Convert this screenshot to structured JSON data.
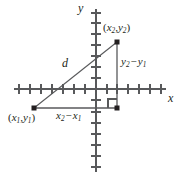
{
  "figure": {
    "type": "coordinate-plane-distance-formula",
    "background_color": "#ffffff",
    "stroke_color": "#58595b",
    "ink_color": "#231f20"
  },
  "axes": {
    "x_axis_label": "x",
    "y_axis_label": "y",
    "origin_px": {
      "x": 96,
      "y": 89
    },
    "tick_spacing_px": 11,
    "x_ticks_left_of_origin": 7,
    "x_ticks_right_of_origin": 6,
    "y_ticks_above_origin": 7,
    "y_ticks_below_origin": 7,
    "grid": false
  },
  "points": [
    {
      "name": "point-1",
      "label_parts": {
        "open": "(",
        "x_var": "x",
        "x_sub": "1",
        "comma": ",",
        "y_var": "y",
        "y_sub": "1",
        "close": ")"
      },
      "label_text": "(x1,y1)",
      "px": {
        "x": 34,
        "y": 108
      },
      "label_px": {
        "x": 8,
        "y": 112
      }
    },
    {
      "name": "point-2",
      "label_parts": {
        "open": "(",
        "x_var": "x",
        "x_sub": "2",
        "comma": ",",
        "y_var": "y",
        "y_sub": "2",
        "close": ")"
      },
      "label_text": "(x2,y2)",
      "px": {
        "x": 117,
        "y": 42
      },
      "label_px": {
        "x": 103,
        "y": 22
      }
    },
    {
      "name": "right-angle-vertex",
      "px": {
        "x": 117,
        "y": 108
      }
    }
  ],
  "segments": {
    "hypotenuse": {
      "name": "distance-segment",
      "label": "d",
      "label_px": {
        "x": 62,
        "y": 58
      },
      "from": {
        "x": 34,
        "y": 108
      },
      "to": {
        "x": 117,
        "y": 42
      }
    },
    "vertical_leg": {
      "name": "vertical-leg",
      "label_parts": {
        "y_var": "y",
        "sub_2": "2",
        "minus": "−",
        "y_var_b": "y",
        "sub_1": "1"
      },
      "label_text": "y2 − y1",
      "label_px": {
        "x": 121,
        "y": 56
      },
      "from": {
        "x": 117,
        "y": 42
      },
      "to": {
        "x": 117,
        "y": 108
      }
    },
    "horizontal_leg": {
      "name": "horizontal-leg",
      "label_parts": {
        "x_var": "x",
        "sub_2": "2",
        "minus": "−",
        "x_var_b": "x",
        "sub_1": "1"
      },
      "label_text": "x2 − x1",
      "label_px": {
        "x": 56,
        "y": 110
      },
      "from": {
        "x": 34,
        "y": 108
      },
      "to": {
        "x": 117,
        "y": 108
      }
    }
  },
  "right_angle_marker": {
    "name": "right-angle-marker",
    "size_px": 9,
    "corner": {
      "x": 117,
      "y": 108
    }
  }
}
